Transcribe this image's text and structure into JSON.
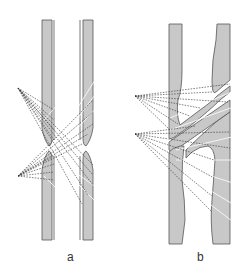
{
  "figure": {
    "panels": [
      {
        "id": "a",
        "label": "a",
        "description": "Two parallel straight strips, each with an aperture gap, with dashed ray fans from two point sources crossing between them"
      },
      {
        "id": "b",
        "label": "b",
        "description": "Two strips joined by a diagonal bridge forming an X-shaped crossover, with dashed ray fans from two point sources"
      }
    ],
    "colors": {
      "strip_fill": "#c8c8c8",
      "strip_outline": "#555555",
      "ray_dashed": "#333333",
      "ray_white": "#ffffff",
      "background": "#ffffff"
    }
  }
}
